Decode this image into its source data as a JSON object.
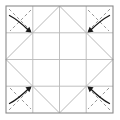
{
  "figure": {
    "type": "origami-diagram",
    "canvas": {
      "width": 120,
      "height": 120,
      "background": "#ffffff"
    },
    "colors": {
      "background": "#ffffff",
      "border": "#8a8a8a",
      "crease_solid": "#b9b9b9",
      "crease_dashed": "#9a9a9a",
      "arrow": "#1a1a1a"
    },
    "sheet": {
      "name": "outer-square",
      "left": 6,
      "top": 6,
      "right": 113,
      "bottom": 113,
      "stroke_width": 1.1
    },
    "grid": {
      "name": "quarter-grid",
      "vertical_x": [
        32.8,
        59.5,
        86.2
      ],
      "horizontal_y": [
        32.8,
        59.5,
        86.2
      ],
      "stroke_width": 0.9
    },
    "diamond": {
      "name": "inner-diamond",
      "points": [
        {
          "label": "top",
          "x": 59.5,
          "y": 6
        },
        {
          "label": "right",
          "x": 113,
          "y": 59.5
        },
        {
          "label": "bottom",
          "x": 59.5,
          "y": 113
        },
        {
          "label": "left",
          "x": 6,
          "y": 59.5
        }
      ],
      "stroke_width": 1.0
    },
    "corner_folds": [
      {
        "name": "fold-top-left",
        "corner": "top-left",
        "dashed_lines": [
          {
            "x1": 9,
            "y1": 9,
            "x2": 31,
            "y2": 31
          },
          {
            "x1": 31,
            "y1": 10,
            "x2": 10,
            "y2": 31
          }
        ],
        "arrow": {
          "name": "arrow-top-left",
          "from": {
            "x": 9.5,
            "y": 15.5
          },
          "to": {
            "x": 31.5,
            "y": 32.5
          },
          "curve": {
            "x": 18,
            "y": 20
          },
          "direction": "down-right",
          "head_size": 5.2
        }
      },
      {
        "name": "fold-top-right",
        "corner": "top-right",
        "dashed_lines": [
          {
            "x1": 110,
            "y1": 9,
            "x2": 88,
            "y2": 31
          },
          {
            "x1": 88,
            "y1": 10,
            "x2": 109,
            "y2": 31
          }
        ],
        "arrow": {
          "name": "arrow-top-right",
          "from": {
            "x": 109.5,
            "y": 15.5
          },
          "to": {
            "x": 87.5,
            "y": 32.5
          },
          "curve": {
            "x": 101,
            "y": 20
          },
          "direction": "down-left",
          "head_size": 5.2
        }
      },
      {
        "name": "fold-bottom-left",
        "corner": "bottom-left",
        "dashed_lines": [
          {
            "x1": 9,
            "y1": 110,
            "x2": 31,
            "y2": 88
          },
          {
            "x1": 10,
            "y1": 88,
            "x2": 31,
            "y2": 109
          }
        ],
        "arrow": {
          "name": "arrow-bottom-left",
          "from": {
            "x": 9.5,
            "y": 103.5
          },
          "to": {
            "x": 31.5,
            "y": 86.5
          },
          "curve": {
            "x": 18,
            "y": 99
          },
          "direction": "up-right",
          "head_size": 5.2
        }
      },
      {
        "name": "fold-bottom-right",
        "corner": "bottom-right",
        "dashed_lines": [
          {
            "x1": 110,
            "y1": 110,
            "x2": 88,
            "y2": 88
          },
          {
            "x1": 109,
            "y1": 88,
            "x2": 88,
            "y2": 109
          }
        ],
        "arrow": {
          "name": "arrow-bottom-right",
          "from": {
            "x": 109.5,
            "y": 103.5
          },
          "to": {
            "x": 87.5,
            "y": 86.5
          },
          "curve": {
            "x": 101,
            "y": 99
          },
          "direction": "up-left",
          "head_size": 5.2
        }
      }
    ]
  }
}
